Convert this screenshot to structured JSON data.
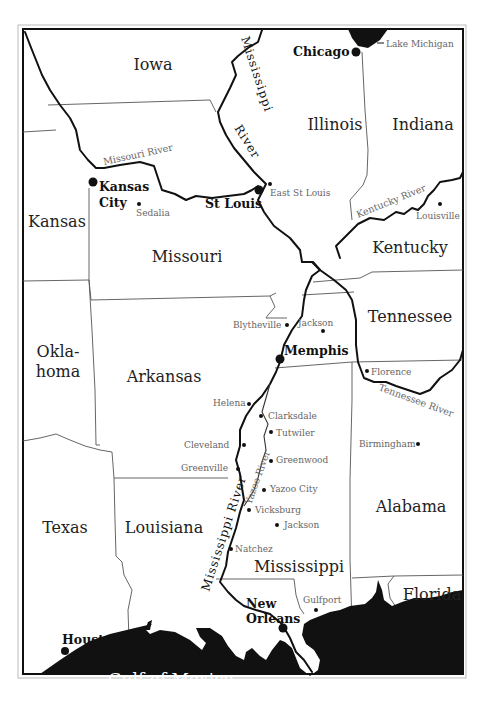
{
  "map": {
    "states": [
      {
        "name": "Iowa",
        "x": 153,
        "y": 70
      },
      {
        "name": "Illinois",
        "x": 335,
        "y": 130
      },
      {
        "name": "Indiana",
        "x": 423,
        "y": 130
      },
      {
        "name": "Kansas",
        "x": 57,
        "y": 227
      },
      {
        "name": "Missouri",
        "x": 187,
        "y": 262
      },
      {
        "name": "Kentucky",
        "x": 410,
        "y": 253
      },
      {
        "name": "Tennessee",
        "x": 410,
        "y": 322
      },
      {
        "name": "Okla-",
        "x": 58,
        "y": 357
      },
      {
        "name": "homa",
        "x": 58,
        "y": 377
      },
      {
        "name": "Arkansas",
        "x": 164,
        "y": 382
      },
      {
        "name": "Alabama",
        "x": 411,
        "y": 512
      },
      {
        "name": "Texas",
        "x": 65,
        "y": 533
      },
      {
        "name": "Louisiana",
        "x": 164,
        "y": 533
      },
      {
        "name": "Mississippi",
        "x": 299,
        "y": 572
      },
      {
        "name": "Florida",
        "x": 432,
        "y": 600
      }
    ],
    "major_cities": [
      {
        "name": "Chicago",
        "label_x": 293,
        "label_y": 56,
        "dot_x": 356,
        "dot_y": 52
      },
      {
        "name": "Kansas",
        "label_x": 99,
        "label_y": 191,
        "dot_x": 93,
        "dot_y": 182
      },
      {
        "name": "City",
        "label_x": 99,
        "label_y": 207,
        "dot_x": null,
        "dot_y": null
      },
      {
        "name": "St Louis",
        "label_x": 205,
        "label_y": 208,
        "dot_x": 259,
        "dot_y": 190
      },
      {
        "name": "Memphis",
        "label_x": 284,
        "label_y": 355,
        "dot_x": 280,
        "dot_y": 359
      },
      {
        "name": "New",
        "label_x": 246,
        "label_y": 608,
        "dot_x": null,
        "dot_y": null
      },
      {
        "name": "Orleans",
        "label_x": 246,
        "label_y": 623,
        "dot_x": 283,
        "dot_y": 628
      },
      {
        "name": "Houston",
        "label_x": 62,
        "label_y": 644,
        "dot_x": 65,
        "dot_y": 651
      }
    ],
    "minor_cities": [
      {
        "name": "Lake Michigan",
        "label_x": 382,
        "label_y": 47,
        "dot_x": null,
        "dot_y": null
      },
      {
        "name": "Sedalia",
        "label_x": 136,
        "label_y": 216,
        "dot_x": 139,
        "dot_y": 204
      },
      {
        "name": "East St Louis",
        "label_x": 270,
        "label_y": 196,
        "dot_x": 270,
        "dot_y": 184
      },
      {
        "name": "Louisville",
        "label_x": 416,
        "label_y": 219,
        "dot_x": 440,
        "dot_y": 204
      },
      {
        "name": "Blytheville",
        "label_x": 233,
        "label_y": 328,
        "dot_x": 287,
        "dot_y": 325
      },
      {
        "name": "Jackson",
        "label_x": 298,
        "label_y": 326,
        "dot_x": 323,
        "dot_y": 331
      },
      {
        "name": "Florence",
        "label_x": 371,
        "label_y": 375,
        "dot_x": 367,
        "dot_y": 371
      },
      {
        "name": "Helena",
        "label_x": 213,
        "label_y": 406,
        "dot_x": 249,
        "dot_y": 404
      },
      {
        "name": "Clarksdale",
        "label_x": 268,
        "label_y": 419,
        "dot_x": 261,
        "dot_y": 416
      },
      {
        "name": "Tutwiler",
        "label_x": 276,
        "label_y": 436,
        "dot_x": 271,
        "dot_y": 432
      },
      {
        "name": "Birmingham",
        "label_x": 359,
        "label_y": 447,
        "dot_x": 418,
        "dot_y": 444
      },
      {
        "name": "Cleveland",
        "label_x": 184,
        "label_y": 448,
        "dot_x": 244,
        "dot_y": 445
      },
      {
        "name": "Greenwood",
        "label_x": 276,
        "label_y": 463,
        "dot_x": 271,
        "dot_y": 461
      },
      {
        "name": "Greenville",
        "label_x": 181,
        "label_y": 471,
        "dot_x": 238,
        "dot_y": 469
      },
      {
        "name": "Yazoo City",
        "label_x": 270,
        "label_y": 492,
        "dot_x": 264,
        "dot_y": 490
      },
      {
        "name": "Vicksburg",
        "label_x": 255,
        "label_y": 513,
        "dot_x": 249,
        "dot_y": 510
      },
      {
        "name": "Jackson",
        "label_x": 284,
        "label_y": 528,
        "dot_x": 277,
        "dot_y": 525
      },
      {
        "name": "Natchez",
        "label_x": 235,
        "label_y": 552,
        "dot_x": 231,
        "dot_y": 549
      },
      {
        "name": "Gulfport",
        "label_x": 303,
        "label_y": 603,
        "dot_x": 316,
        "dot_y": 610
      }
    ],
    "rivers": [
      {
        "name": "Mississippi River",
        "segment": "north"
      },
      {
        "name": "Missouri River",
        "segment": "west"
      },
      {
        "name": "Kentucky River",
        "segment": "east"
      },
      {
        "name": "Tennessee River",
        "segment": "southeast"
      },
      {
        "name": "Yazoo River",
        "segment": "delta"
      },
      {
        "name": "Mississippi River",
        "segment": "south"
      }
    ],
    "water_bodies": [
      "Gulf of Mexico",
      "Lake Michigan"
    ],
    "labels": {
      "miss_north_1": "Mississippi",
      "miss_north_2": "River",
      "missouri_river": "Missouri River",
      "kentucky_river": "Kentucky River",
      "tennessee_river": "Tennessee River",
      "yazoo_river": "Yazoo River",
      "miss_south": "Mississippi River",
      "gulf": "Gulf of Mexico"
    },
    "colors": {
      "ink": "#111111",
      "border": "#555555",
      "minor_text": "#666666",
      "paper": "#ffffff"
    }
  }
}
